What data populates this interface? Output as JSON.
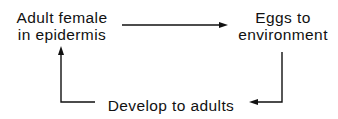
{
  "diagram": {
    "type": "life-cycle-flow",
    "nodes": [
      {
        "id": "adult",
        "lines": [
          "Adult female",
          "in epidermis"
        ]
      },
      {
        "id": "eggs",
        "lines": [
          "Eggs to",
          "environment"
        ]
      },
      {
        "id": "develop",
        "lines": [
          "Develop to adults"
        ]
      }
    ],
    "edges": [
      {
        "from": "adult",
        "to": "eggs"
      },
      {
        "from": "eggs",
        "to": "develop"
      },
      {
        "from": "develop",
        "to": "adult"
      }
    ],
    "colors": {
      "line": "#111111",
      "text": "#111111",
      "background": "#ffffff"
    }
  }
}
